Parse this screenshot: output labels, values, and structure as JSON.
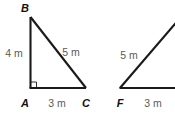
{
  "figure": {
    "background_color": "#ffffff",
    "line_color": "#1a1a1a",
    "label_color": "#111111",
    "measure_color": "#5a5a5a"
  },
  "triangles": [
    {
      "id": "triangle-abc",
      "vertices": [
        {
          "name": "B",
          "label": "B"
        },
        {
          "name": "A",
          "label": "A"
        },
        {
          "name": "C",
          "label": "C"
        }
      ],
      "sides": [
        {
          "name": "leg-ab",
          "label": "4 m"
        },
        {
          "name": "hypotenuse-bc",
          "label": "5 m"
        },
        {
          "name": "base-ac",
          "label": "3 m"
        }
      ],
      "right_angle_at": "A"
    },
    {
      "id": "triangle-f",
      "vertices": [
        {
          "name": "F",
          "label": "F"
        }
      ],
      "sides": [
        {
          "name": "hypotenuse-f",
          "label": "5 m"
        },
        {
          "name": "base-f",
          "label": "3 m"
        }
      ],
      "clipped": true
    }
  ]
}
